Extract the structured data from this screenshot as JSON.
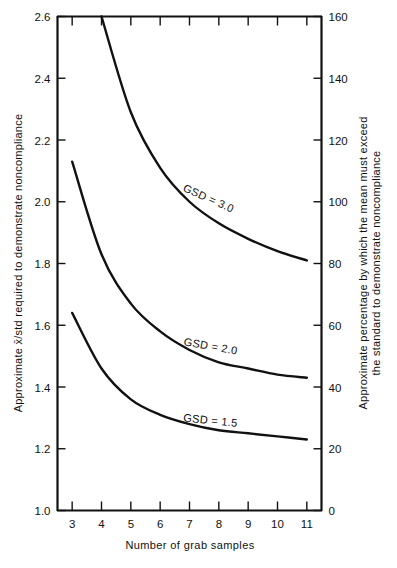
{
  "chart_data": {
    "type": "line",
    "title": "",
    "xlabel": "Number of grab samples",
    "ylabel": "Approximate x̄/std required to demonstrate noncompliance",
    "ylabel_right_line1": "Approximate percentage by which the mean must exceed",
    "ylabel_right_line2": "the standard to demonstrate noncompliance",
    "xlim": [
      2.5,
      11.5
    ],
    "ylim": [
      1.0,
      2.6
    ],
    "ylim_right": [
      0,
      160
    ],
    "grid": false,
    "legend": "inline-curve-labels",
    "xticks": [
      3,
      4,
      5,
      6,
      7,
      8,
      9,
      10,
      11
    ],
    "xticklabels": [
      "3",
      "4",
      "5",
      "6",
      "7",
      "8",
      "9",
      "10",
      "11"
    ],
    "yticks": [
      1.0,
      1.2,
      1.4,
      1.6,
      1.8,
      2.0,
      2.2,
      2.4,
      2.6
    ],
    "yticklabels": [
      "1.0",
      "1.2",
      "1.4",
      "1.6",
      "1.8",
      "2.0",
      "2.2",
      "2.4",
      "2.6"
    ],
    "yticks_right": [
      0,
      20,
      40,
      60,
      80,
      100,
      120,
      140,
      160
    ],
    "yticklabels_right": [
      "0",
      "20",
      "40",
      "60",
      "80",
      "100",
      "120",
      "140",
      "160"
    ],
    "x": [
      3,
      4,
      5,
      6,
      7,
      8,
      9,
      10,
      11
    ],
    "series": [
      {
        "name": "GSD = 3.0",
        "label": "GSD = 3.0",
        "values": [
          3.35,
          2.6,
          2.29,
          2.11,
          2.0,
          1.93,
          1.88,
          1.84,
          1.81
        ],
        "x_start": 4.0,
        "y_start": 2.6,
        "color": "#111111"
      },
      {
        "name": "GSD = 2.0",
        "label": "GSD = 2.0",
        "values": [
          2.13,
          1.83,
          1.67,
          1.58,
          1.52,
          1.48,
          1.46,
          1.44,
          1.43
        ],
        "x_start": 3.0,
        "y_start": 2.13,
        "color": "#111111"
      },
      {
        "name": "GSD = 1.5",
        "label": "GSD = 1.5",
        "values": [
          1.64,
          1.46,
          1.36,
          1.31,
          1.28,
          1.26,
          1.25,
          1.24,
          1.23
        ],
        "x_start": 3.0,
        "y_start": 1.64,
        "color": "#111111"
      }
    ],
    "annotations": [
      {
        "text": "GSD = 3.0",
        "x": 7.6,
        "y": 2.0,
        "rotation": 24
      },
      {
        "text": "GSD = 2.0",
        "x": 7.7,
        "y": 1.52,
        "rotation": 10
      },
      {
        "text": "GSD = 1.5",
        "x": 7.7,
        "y": 1.28,
        "rotation": 6
      }
    ]
  },
  "axes": {
    "x_title": "Number of grab samples",
    "y_left_title": "Approximate x̄/std required to demonstrate noncompliance",
    "y_right_title_line1": "Approximate percentage by which the mean must exceed",
    "y_right_title_line2": "the standard to demonstrate noncompliance"
  },
  "curve_labels": {
    "gsd30": "GSD = 3.0",
    "gsd20": "GSD = 2.0",
    "gsd15": "GSD = 1.5"
  },
  "yticks_left": {
    "t0": "1.0",
    "t1": "1.2",
    "t2": "1.4",
    "t3": "1.6",
    "t4": "1.8",
    "t5": "2.0",
    "t6": "2.2",
    "t7": "2.4",
    "t8": "2.6"
  },
  "yticks_right": {
    "t0": "0",
    "t1": "20",
    "t2": "40",
    "t3": "60",
    "t4": "80",
    "t5": "100",
    "t6": "120",
    "t7": "140",
    "t8": "160"
  },
  "xticks": {
    "t0": "3",
    "t1": "4",
    "t2": "5",
    "t3": "6",
    "t4": "7",
    "t5": "8",
    "t6": "9",
    "t7": "10",
    "t8": "11"
  },
  "colors": {
    "ink": "#111111",
    "paper": "#ffffff"
  }
}
